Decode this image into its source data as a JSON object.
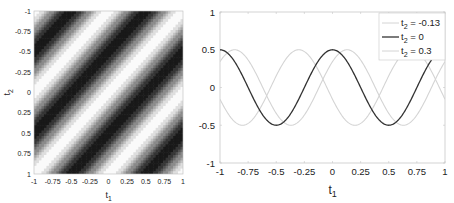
{
  "chart_data": [
    {
      "type": "heatmap",
      "title": "",
      "xlabel": "t1",
      "ylabel": "t2",
      "x_range": [
        -1,
        1
      ],
      "y_range": [
        -1,
        1
      ],
      "y_reversed": true,
      "x_ticks": [
        "-1",
        "-0.75",
        "-0.5",
        "-0.25",
        "0",
        "0.25",
        "0.5",
        "0.75",
        "1"
      ],
      "y_ticks": [
        "-1",
        "-0.75",
        "-0.5",
        "-0.25",
        "0",
        "0.25",
        "0.5",
        "0.75",
        "1"
      ],
      "function": "0.5*cos(2*pi*(t1+t2))",
      "colormap": "gray",
      "grid": false
    },
    {
      "type": "line",
      "title": "",
      "xlabel": "t1",
      "ylabel": "",
      "xlim": [
        -1,
        1
      ],
      "ylim": [
        -1,
        1
      ],
      "x_ticks": [
        "-1",
        "-0.75",
        "-0.5",
        "-0.25",
        "0",
        "0.25",
        "0.5",
        "0.75",
        "1"
      ],
      "y_ticks": [
        "1",
        "0.5",
        "0",
        "-0.5",
        "-1"
      ],
      "legend_position": "upper right",
      "series": [
        {
          "name": "t2 = -0.13",
          "t2": -0.13,
          "color": "#d4d4d4",
          "function": "0.5*cos(2*pi*(t1+t2))"
        },
        {
          "name": "t2 = 0",
          "t2": 0,
          "color": "#333333",
          "function": "0.5*cos(2*pi*(t1+t2))"
        },
        {
          "name": "t2 = 0.3",
          "t2": 0.3,
          "color": "#d4d4d4",
          "function": "0.5*cos(2*pi*(t1+t2))"
        }
      ],
      "sample_points": {
        "x": [
          -1,
          -0.75,
          -0.5,
          -0.25,
          0,
          0.25,
          0.5,
          0.75,
          1
        ],
        "t2_0": [
          0.5,
          0,
          -0.5,
          0,
          0.5,
          0,
          -0.5,
          0,
          0.5
        ]
      }
    }
  ],
  "left": {
    "xlabel": "t",
    "xlabel_sub": "1",
    "ylabel": "t",
    "ylabel_sub": "2",
    "x_ticks": [
      "-1",
      "-0.75",
      "-0.5",
      "-0.25",
      "0",
      "0.25",
      "0.5",
      "0.75",
      "1"
    ],
    "y_ticks": [
      "-1",
      "-0.75",
      "-0.5",
      "-0.25",
      "0",
      "0.25",
      "0.5",
      "0.75",
      "1"
    ]
  },
  "right": {
    "xlabel": "t",
    "xlabel_sub": "1",
    "x_ticks": [
      "-1",
      "-0.75",
      "-0.5",
      "-0.25",
      "0",
      "0.25",
      "0.5",
      "0.75",
      "1"
    ],
    "y_ticks": [
      "1",
      "0.5",
      "0",
      "-0.5",
      "-1"
    ],
    "legend": [
      {
        "prefix": "t",
        "sub": "2",
        "suffix": " = -0.13"
      },
      {
        "prefix": "t",
        "sub": "2",
        "suffix": " = 0"
      },
      {
        "prefix": "t",
        "sub": "2",
        "suffix": " = 0.3"
      }
    ]
  }
}
